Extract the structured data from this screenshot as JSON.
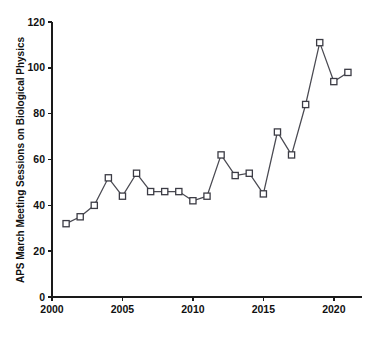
{
  "chart_data": {
    "type": "line",
    "title": "",
    "subtitle": "",
    "xlabel": "",
    "ylabel": "APS March Meeting Sessions on Biological Physics",
    "xlim": [
      2000,
      2022
    ],
    "ylim": [
      0,
      120
    ],
    "grid": false,
    "legend": false,
    "legend_position": "none",
    "marker": "open-square",
    "line_color": "#4a4a52",
    "marker_face_color": "#ffffff",
    "marker_edge_color": "#3c3c45",
    "xticks": [
      2000,
      2005,
      2010,
      2015,
      2020
    ],
    "xtick_labels": [
      "2000",
      "2005",
      "2010",
      "2015",
      "2020"
    ],
    "yticks": [
      0,
      20,
      40,
      60,
      80,
      100,
      120
    ],
    "ytick_labels": [
      "0",
      "20",
      "40",
      "60",
      "80",
      "100",
      "120"
    ],
    "x": [
      2001,
      2002,
      2003,
      2004,
      2005,
      2006,
      2007,
      2008,
      2009,
      2010,
      2011,
      2012,
      2013,
      2014,
      2015,
      2016,
      2017,
      2018,
      2019,
      2020,
      2021
    ],
    "values": [
      32,
      35,
      40,
      52,
      44,
      54,
      46,
      46,
      46,
      42,
      44,
      62,
      53,
      54,
      45,
      72,
      62,
      84,
      111,
      94,
      98
    ],
    "series": [
      {
        "name": "APS March Meeting Sessions on Biological Physics",
        "x": [
          2001,
          2002,
          2003,
          2004,
          2005,
          2006,
          2007,
          2008,
          2009,
          2010,
          2011,
          2012,
          2013,
          2014,
          2015,
          2016,
          2017,
          2018,
          2019,
          2020,
          2021
        ],
        "values": [
          32,
          35,
          40,
          52,
          44,
          54,
          46,
          46,
          46,
          42,
          44,
          62,
          53,
          54,
          45,
          72,
          62,
          84,
          111,
          94,
          98
        ]
      }
    ],
    "annotations": []
  }
}
